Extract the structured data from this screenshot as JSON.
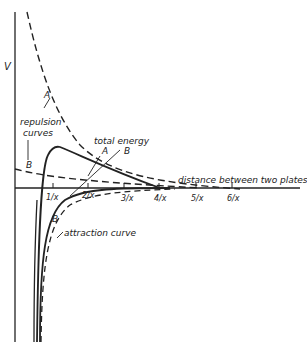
{
  "diagram": {
    "y_axis_label": "V",
    "x_axis_label": "distance between two plates",
    "x_ticks": [
      "1/x",
      "2/x",
      "3/x",
      "4/x",
      "5/x",
      "6/x"
    ],
    "labels": {
      "repulsion_curves": [
        "repulsion",
        "curves"
      ],
      "repulsion_a": "A",
      "repulsion_b": "B",
      "total_energy": "total  energy",
      "total_a": "A",
      "total_b": "B",
      "attraction_b": "B",
      "attraction_curve": "attraction curve"
    },
    "colors": {
      "ink": "#222222",
      "background": "#ffffff"
    }
  }
}
